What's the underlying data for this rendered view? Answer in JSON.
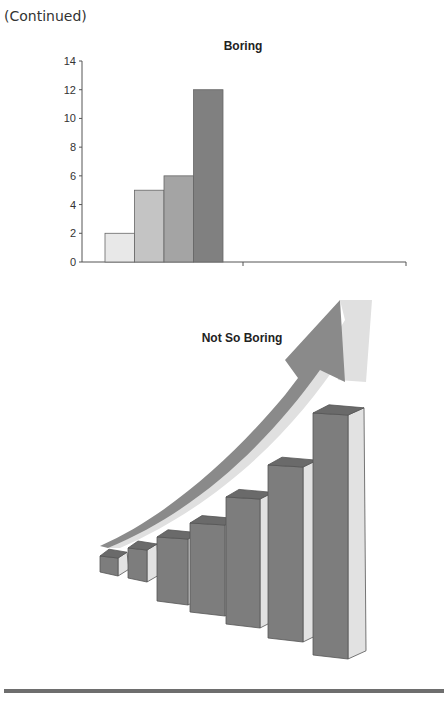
{
  "header": {
    "continued_label": "(Continued)"
  },
  "chart_data": [
    {
      "type": "bar",
      "title": "Boring",
      "categories": [
        "1",
        "2",
        "3",
        "4"
      ],
      "values": [
        2,
        5,
        6,
        12
      ],
      "bar_colors": [
        "#e8e8e8",
        "#c4c4c4",
        "#a4a4a4",
        "#808080"
      ],
      "xlabel": "",
      "ylabel": "",
      "ylim": [
        0,
        14
      ],
      "yticks": [
        0,
        2,
        4,
        6,
        8,
        10,
        12,
        14
      ],
      "grid": false,
      "legend": "none"
    },
    {
      "type": "bar",
      "title": "Not So Boring",
      "style": "3d-bars-with-upward-arrow",
      "categories": [
        "1",
        "2",
        "3",
        "4",
        "5",
        "6",
        "7"
      ],
      "values": [
        1,
        2,
        4,
        5,
        7,
        10,
        14
      ],
      "front_color": "#7d7d7d",
      "side_color": "#e2e2e2",
      "top_color": "#6a6a6a",
      "arrow_colors": {
        "dark": "#8a8a8a",
        "light": "#e0e0e0"
      },
      "grid": false,
      "legend": "none"
    }
  ]
}
